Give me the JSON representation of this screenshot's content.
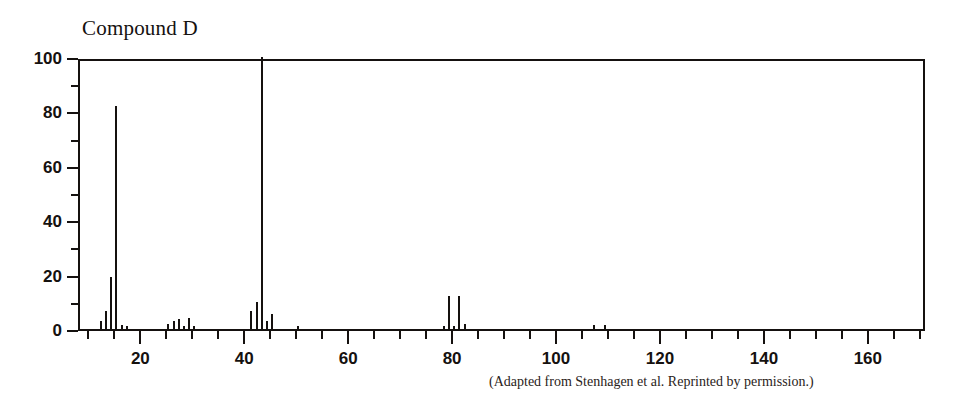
{
  "title": "Compound D",
  "caption": "(Adapted from Stenhagen et al. Reprinted by permission.)",
  "colors": {
    "ink": "#15110f",
    "background": "#ffffff",
    "caption_ink": "#2a2320"
  },
  "chart_data": {
    "type": "bar",
    "title": "Compound D",
    "subtitle": "",
    "xlabel": "",
    "ylabel": "",
    "xlim": [
      8,
      171
    ],
    "ylim": [
      0,
      100
    ],
    "grid": false,
    "legend": null,
    "x_major_ticks": [
      20,
      40,
      60,
      80,
      100,
      120,
      140,
      160
    ],
    "x_minor_tick_step": 5,
    "x_tick_labels": [
      "20",
      "40",
      "60",
      "80",
      "100",
      "120",
      "140",
      "160"
    ],
    "y_major_ticks": [
      0,
      20,
      40,
      60,
      80,
      100
    ],
    "y_minor_tick_step": 10,
    "y_tick_labels": [
      "0",
      "20",
      "40",
      "60",
      "80",
      "100"
    ],
    "series_name": "relative abundance",
    "x": [
      12,
      13,
      14,
      15,
      16,
      17,
      25,
      26,
      27,
      28,
      29,
      30,
      41,
      42,
      43,
      44,
      45,
      50,
      78,
      79,
      80,
      81,
      82,
      107,
      109
    ],
    "values": [
      3.0,
      6.5,
      19.0,
      82.0,
      1.5,
      1.0,
      2.0,
      3.0,
      3.5,
      1.0,
      4.0,
      1.0,
      6.5,
      10.0,
      100.0,
      3.0,
      5.5,
      1.0,
      1.0,
      12.0,
      1.0,
      12.0,
      2.0,
      1.5,
      1.5
    ],
    "base_peak": {
      "mz": 43,
      "abundance": 100
    },
    "notable_peaks": [
      {
        "mz": 15,
        "abundance": 82
      },
      {
        "mz": 14,
        "abundance": 19
      },
      {
        "mz": 79,
        "abundance": 12
      },
      {
        "mz": 81,
        "abundance": 12
      },
      {
        "mz": 42,
        "abundance": 10
      }
    ]
  }
}
